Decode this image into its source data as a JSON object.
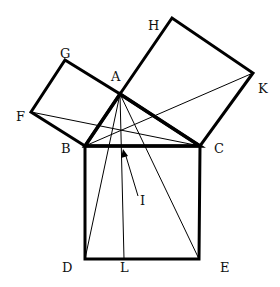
{
  "diagram": {
    "points": {
      "A": {
        "x": 120,
        "y": 94
      },
      "B": {
        "x": 85,
        "y": 146
      },
      "C": {
        "x": 200,
        "y": 146
      },
      "D": {
        "x": 85,
        "y": 259
      },
      "E": {
        "x": 199,
        "y": 259
      },
      "L": {
        "x": 124,
        "y": 259
      },
      "F": {
        "x": 31,
        "y": 112
      },
      "G": {
        "x": 65,
        "y": 60
      },
      "H": {
        "x": 172,
        "y": 18
      },
      "K": {
        "x": 253,
        "y": 73
      }
    },
    "labels": {
      "A": "A",
      "B": "B",
      "C": "C",
      "D": "D",
      "E": "E",
      "F": "F",
      "G": "G",
      "H": "H",
      "K": "K",
      "L": "L",
      "I": "I"
    },
    "colors": {
      "stroke": "#000000",
      "background": "#ffffff"
    }
  }
}
